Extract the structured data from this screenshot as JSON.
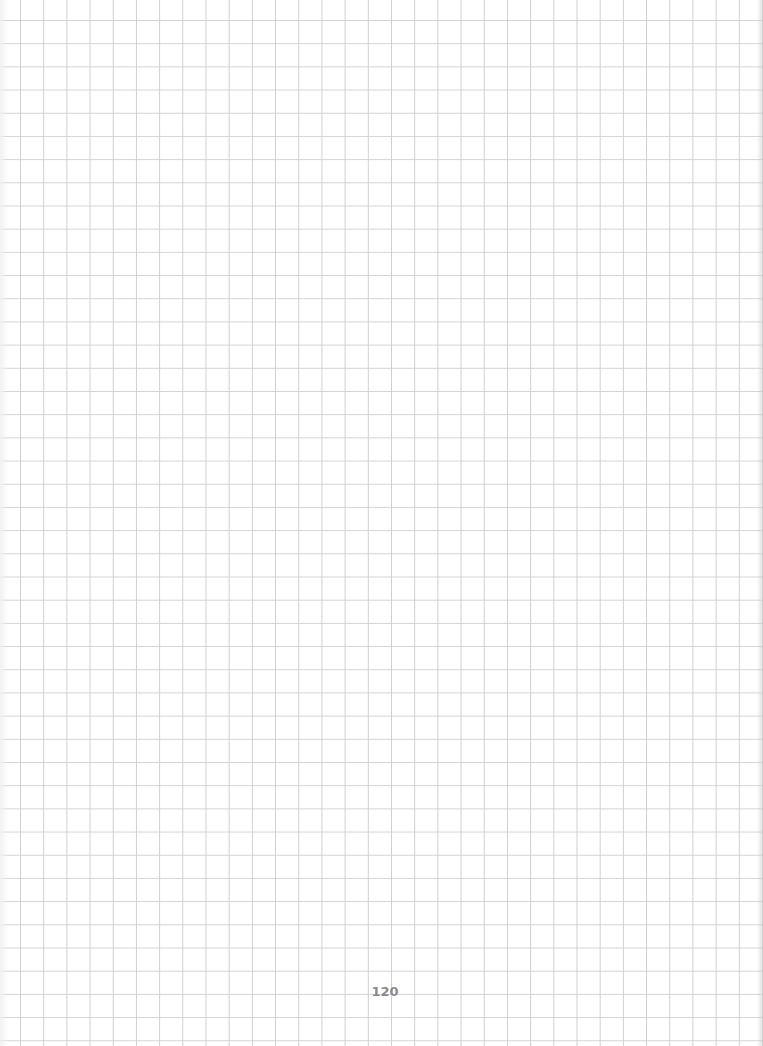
{
  "page": {
    "type": "grid-paper",
    "grid_color": "#d0d0d2",
    "background_color": "#ffffff",
    "page_number": "120"
  }
}
